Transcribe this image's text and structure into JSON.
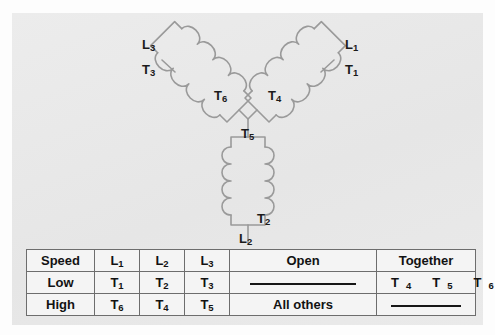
{
  "figure": {
    "type": "wye-connected two-speed motor winding diagram",
    "leads": [
      {
        "id": "L3",
        "name": "L",
        "sub": "3",
        "x": 143,
        "y": 32
      },
      {
        "id": "T3",
        "name": "T",
        "sub": "3",
        "x": 143,
        "y": 57
      },
      {
        "id": "L1",
        "name": "L",
        "sub": "1",
        "x": 345,
        "y": 32
      },
      {
        "id": "T1",
        "name": "T",
        "sub": "1",
        "x": 345,
        "y": 57
      },
      {
        "id": "T6",
        "name": "T",
        "sub": "6",
        "x": 215,
        "y": 84
      },
      {
        "id": "T4",
        "name": "T",
        "sub": "4",
        "x": 268,
        "y": 84
      },
      {
        "id": "T5",
        "name": "T",
        "sub": "5",
        "x": 243,
        "y": 122
      },
      {
        "id": "T2",
        "name": "T",
        "sub": "2",
        "x": 257,
        "y": 207
      },
      {
        "id": "L2",
        "name": "L",
        "sub": "2",
        "x": 240,
        "y": 226
      }
    ],
    "coils": [
      {
        "name": "coil-left-t6",
        "label": "T6",
        "lead_top": "L3",
        "lead_tap": "T3"
      },
      {
        "name": "coil-right-t4",
        "label": "T4",
        "lead_top": "L1",
        "lead_tap": "T1"
      },
      {
        "name": "coil-bottom-t5",
        "label": "T5",
        "lead_bottom": "L2",
        "lead_tap": "T2"
      }
    ],
    "colors": {
      "panel_bg": "#e9e9e9",
      "page_bg": "#fdfdfd",
      "coil_line": "#9a9a9a",
      "text": "#121212",
      "table_border": "#6d6d6d",
      "table_bg": "#f4f4f4"
    }
  },
  "table": {
    "name": "speed-connection-table",
    "headers": [
      "Speed",
      "L1",
      "L2",
      "L3",
      "Open",
      "Together"
    ],
    "headers_parts": [
      {
        "text": "Speed",
        "sub": ""
      },
      {
        "text": "L",
        "sub": "1"
      },
      {
        "text": "L",
        "sub": "2"
      },
      {
        "text": "L",
        "sub": "3"
      },
      {
        "text": "Open",
        "sub": ""
      },
      {
        "text": "Together",
        "sub": ""
      }
    ],
    "rows": [
      {
        "speed": "Low",
        "l1": {
          "text": "T",
          "sub": "1"
        },
        "l2": {
          "text": "T",
          "sub": "2"
        },
        "l3": {
          "text": "T",
          "sub": "3"
        },
        "open": "",
        "open_is_rule": true,
        "together": [
          "T4",
          "T5",
          "T6"
        ],
        "together_parts": [
          {
            "text": "T",
            "sub": "4"
          },
          {
            "text": "T",
            "sub": "5"
          },
          {
            "text": "T",
            "sub": "6"
          }
        ],
        "together_is_rule": false
      },
      {
        "speed": "High",
        "l1": {
          "text": "T",
          "sub": "6"
        },
        "l2": {
          "text": "T",
          "sub": "4"
        },
        "l3": {
          "text": "T",
          "sub": "5"
        },
        "open": "All others",
        "open_is_rule": false,
        "together": [],
        "together_parts": [],
        "together_is_rule": true
      }
    ]
  }
}
